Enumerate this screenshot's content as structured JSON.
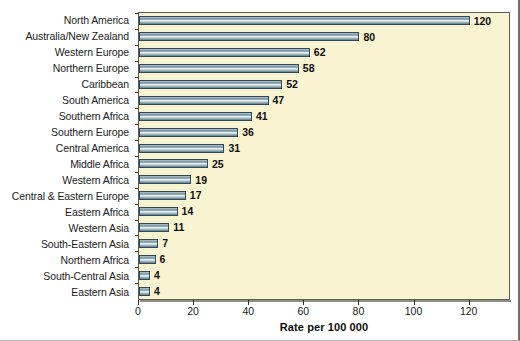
{
  "chart_data": {
    "type": "bar",
    "orientation": "horizontal",
    "title": "",
    "subtitle": "",
    "xlabel": "Rate per 100 000",
    "ylabel": "",
    "xlim": [
      0,
      135
    ],
    "ylim": null,
    "grid": false,
    "legend": null,
    "xticks": [
      0,
      20,
      40,
      60,
      80,
      100,
      120
    ],
    "xtick_labels": [
      "0",
      "20",
      "40",
      "60",
      "80",
      "100",
      "120"
    ],
    "categories": [
      "North America",
      "Australia/New Zealand",
      "Western Europe",
      "Northern Europe",
      "Caribbean",
      "South America",
      "Southern Africa",
      "Southern Europe",
      "Central America",
      "Middle Africa",
      "Western Africa",
      "Central & Eastern Europe",
      "Eastern Africa",
      "Western Asia",
      "South-Eastern Asia",
      "Northern Africa",
      "South-Central Asia",
      "Eastern Asia"
    ],
    "values": [
      120,
      80,
      62,
      58,
      52,
      47,
      41,
      36,
      31,
      25,
      19,
      17,
      14,
      11,
      7,
      6,
      4,
      4
    ],
    "data_labels": [
      "120",
      "80",
      "62",
      "58",
      "52",
      "47",
      "41",
      "36",
      "31",
      "25",
      "19",
      "17",
      "14",
      "11",
      "7",
      "6",
      "4",
      "4"
    ],
    "colors": {
      "plot_background": "#f8f3d0",
      "figure_background": "#ffffff",
      "bar_fill_light": "#eef4f5",
      "bar_fill_mid": "#93aab4",
      "bar_fill_dark": "#62838f",
      "bar_edge": "#2f4a55",
      "axis": "#2d2d29",
      "text": "#1b1b1b"
    }
  }
}
